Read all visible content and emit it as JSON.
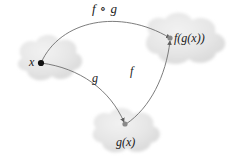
{
  "diagram": {
    "background_color": "#ffffff",
    "cloud_fill_color": "#e8e8e8",
    "curve_color": "#6e6e6e",
    "node_color_x": "#111111",
    "node_color_other": "#7a7a7a",
    "labels": {
      "composition": "f ∘ g",
      "domain_element": "x",
      "inner_result": "g(x)",
      "outer_result": "f(g(x))",
      "inner_map": "g",
      "outer_map": "f"
    },
    "sets": [
      {
        "name": "domain-set",
        "label": "x"
      },
      {
        "name": "codomain-set",
        "label": "f(g(x))"
      },
      {
        "name": "intermediate-set",
        "label": "g(x)"
      }
    ],
    "arrows": [
      {
        "name": "arrow-compose",
        "label": "f ∘ g",
        "from": "x",
        "to": "f(g(x))"
      },
      {
        "name": "arrow-g",
        "label": "g",
        "from": "x",
        "to": "g(x)"
      },
      {
        "name": "arrow-f",
        "label": "f",
        "from": "g(x)",
        "to": "f(g(x))"
      }
    ]
  }
}
